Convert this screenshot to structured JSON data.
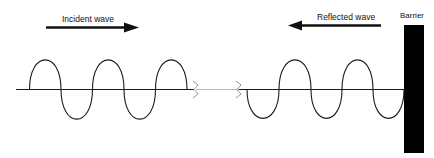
{
  "diagram": {
    "type": "wave-reflection",
    "labels": {
      "incident": "Incident wave",
      "reflected": "Reflected wave",
      "barrier": "Barrier"
    },
    "colors": {
      "stroke": "#1a1a1a",
      "barrier": "#000000",
      "break_line": "#b0b0b0"
    },
    "incident_wave": {
      "direction": "right",
      "cycles": 3,
      "start_phase": "up"
    },
    "reflected_wave": {
      "direction": "left",
      "cycles": 2.5,
      "start_phase": "down"
    }
  }
}
